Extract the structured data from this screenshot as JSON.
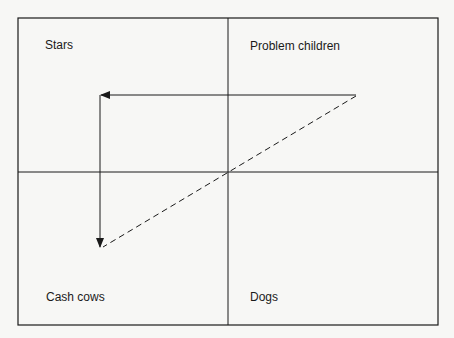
{
  "diagram": {
    "title": "",
    "type": "2x2 matrix (Boston growth-share matrix) with product life-cycle path",
    "quadrants": [
      {
        "id": "top-left",
        "label": "Stars"
      },
      {
        "id": "top-right",
        "label": "Problem children"
      },
      {
        "id": "bottom-left",
        "label": "Cash cows"
      },
      {
        "id": "bottom-right",
        "label": "Dogs"
      }
    ],
    "paths": [
      {
        "style": "solid-arrow",
        "from": "Problem children",
        "to": "Stars",
        "description": "horizontal arrow pointing left"
      },
      {
        "style": "solid-arrow",
        "from": "Stars",
        "to": "Cash cows",
        "description": "vertical arrow pointing down"
      },
      {
        "style": "dashed-line",
        "from": "Problem children",
        "to": "Cash cows",
        "description": "diagonal dashed line through matrix center"
      }
    ],
    "colors": {
      "line": "#1a1a1a",
      "background": "#f7f7f5"
    }
  }
}
